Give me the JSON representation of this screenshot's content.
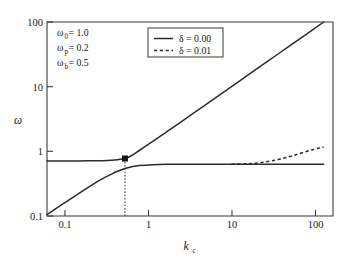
{
  "chart_data": {
    "type": "line",
    "title": "",
    "xlabel": "k_c",
    "ylabel": "ω",
    "xscale": "log",
    "yscale": "log",
    "xlim": [
      0.1,
      126
    ],
    "ylim": [
      0.1,
      100
    ],
    "grid": false,
    "xticks": [
      "0.1",
      "1",
      "10",
      "100"
    ],
    "xtick_values": [
      0.1,
      1,
      10,
      100
    ],
    "yticks": [
      "0.1",
      "1",
      "10",
      "100"
    ],
    "ytick_values": [
      0.1,
      1,
      10,
      100
    ],
    "legend_position": "top-center",
    "series": [
      {
        "name": "δ = 0.00 upper branch",
        "style": "solid",
        "x": [
          0.1,
          0.15,
          0.22,
          0.3,
          0.4,
          0.5,
          0.58,
          0.65,
          0.7,
          0.8,
          1.0,
          1.4,
          2.0,
          3.0,
          5.0,
          8.0,
          14.0,
          25.0,
          45.0,
          70.0,
          100.0
        ],
        "y": [
          0.71,
          0.71,
          0.711,
          0.713,
          0.718,
          0.728,
          0.742,
          0.762,
          0.775,
          0.84,
          1.03,
          1.42,
          2.02,
          3.02,
          5.01,
          8.01,
          14.0,
          25.0,
          45.0,
          70.0,
          100.0
        ]
      },
      {
        "name": "δ = 0.00 lower branch",
        "style": "solid",
        "x": [
          0.1,
          0.15,
          0.22,
          0.3,
          0.4,
          0.5,
          0.6,
          0.7,
          0.85,
          1.0,
          1.4,
          2.0,
          4.0,
          10.0,
          30.0,
          100.0
        ],
        "y": [
          0.105,
          0.155,
          0.222,
          0.296,
          0.378,
          0.445,
          0.5,
          0.543,
          0.583,
          0.603,
          0.622,
          0.629,
          0.632,
          0.633,
          0.633,
          0.633
        ]
      },
      {
        "name": "δ = 0.01",
        "style": "dashed",
        "x": [
          10.0,
          14.0,
          18.0,
          24.0,
          32.0,
          42.0,
          55.0,
          72.0,
          90.0,
          100.0
        ],
        "y": [
          0.633,
          0.64,
          0.655,
          0.69,
          0.745,
          0.825,
          0.925,
          1.04,
          1.13,
          1.17
        ]
      }
    ],
    "markers": [
      {
        "name": "branch-crossing",
        "x": 0.7,
        "y": 0.775,
        "shape": "square",
        "color": "#141414"
      }
    ],
    "reference_lines": [
      {
        "name": "critical-kc-dropline",
        "type": "vertical",
        "x": 0.7,
        "style": "dotted",
        "from_y": 0.1,
        "to_y": 0.775
      }
    ],
    "legend": [
      {
        "label": "δ = 0.00",
        "style": "solid"
      },
      {
        "label": "δ = 0.01",
        "style": "dashed"
      }
    ],
    "annotations": [
      {
        "symbol": "ω",
        "sub": "0",
        "eq": " = 1.0"
      },
      {
        "symbol": "ω",
        "sub": "p",
        "eq": " = 0.2"
      },
      {
        "symbol": "ω",
        "sub": "b",
        "eq": " = 0.5"
      }
    ]
  },
  "axes": {
    "x_label_main": "k",
    "x_label_sub": "c",
    "y_label": "ω",
    "xticks": [
      "0.1",
      "1",
      "10",
      "100"
    ],
    "yticks": [
      "0.1",
      "1",
      "10",
      "100"
    ]
  },
  "legend": {
    "entry0_label": "δ = 0.00",
    "entry1_label": "δ = 0.01"
  },
  "annotations": {
    "row0_symbol": "ω",
    "row0_sub": "0",
    "row0_value": " = 1.0",
    "row1_symbol": "ω",
    "row1_sub": "p",
    "row1_value": " = 0.2",
    "row2_symbol": "ω",
    "row2_sub": "b",
    "row2_value": " = 0.5"
  }
}
